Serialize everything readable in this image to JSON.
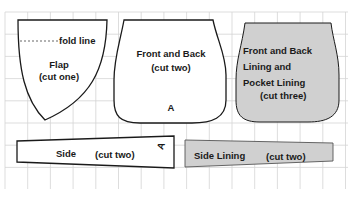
{
  "diagram": {
    "type": "sewing-pattern-layout",
    "grid": {
      "color": "#d4d4d4",
      "background": "#ffffff"
    },
    "colors": {
      "outline": "#1a1a1a",
      "lining_fill": "#d0d0d0",
      "text": "#1a1a1a"
    },
    "pieces": [
      {
        "id": "flap",
        "name": "Flap",
        "cut": "(cut one)",
        "extra": "fold line",
        "filled": false
      },
      {
        "id": "front-back",
        "name": "Front and Back",
        "cut": "(cut two)",
        "marker": "A",
        "filled": false
      },
      {
        "id": "lining",
        "name_lines": [
          "Front and Back",
          "Lining and",
          "Pocket Lining"
        ],
        "cut": "(cut three)",
        "filled": true
      },
      {
        "id": "side",
        "name": "Side",
        "cut": "(cut two)",
        "marker": "A",
        "filled": false
      },
      {
        "id": "side-lining",
        "name": "Side Lining",
        "cut": "(cut two)",
        "filled": true
      }
    ]
  }
}
